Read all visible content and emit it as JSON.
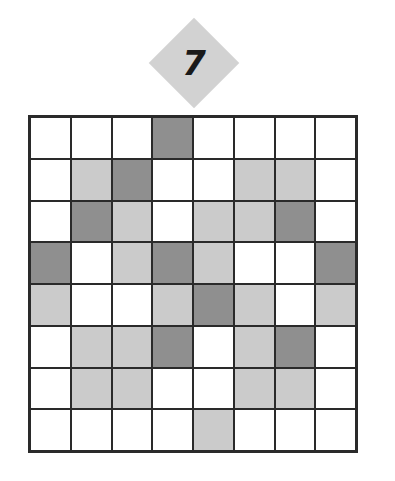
{
  "puzzle": {
    "number": "7",
    "rows": 8,
    "cols": 8,
    "colors": {
      "W": "#ffffff",
      "L": "#cbcbcb",
      "D": "#8f8f8f"
    },
    "grid": [
      [
        "W",
        "W",
        "W",
        "D",
        "W",
        "W",
        "W",
        "W"
      ],
      [
        "W",
        "L",
        "D",
        "W",
        "W",
        "L",
        "L",
        "W"
      ],
      [
        "W",
        "D",
        "L",
        "W",
        "L",
        "L",
        "D",
        "W"
      ],
      [
        "D",
        "W",
        "L",
        "D",
        "L",
        "W",
        "W",
        "D"
      ],
      [
        "L",
        "W",
        "W",
        "L",
        "D",
        "L",
        "W",
        "L"
      ],
      [
        "W",
        "L",
        "L",
        "D",
        "W",
        "L",
        "D",
        "W"
      ],
      [
        "W",
        "L",
        "L",
        "W",
        "W",
        "L",
        "L",
        "W"
      ],
      [
        "W",
        "W",
        "W",
        "W",
        "L",
        "W",
        "W",
        "W"
      ]
    ]
  }
}
